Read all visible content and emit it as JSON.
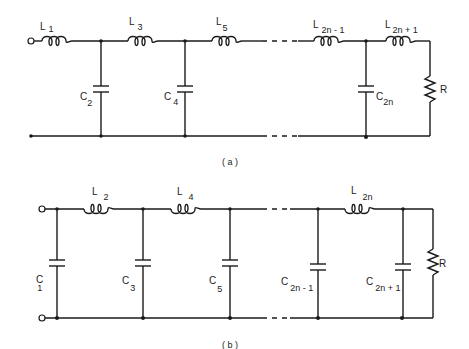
{
  "figure": {
    "a": {
      "caption": "( a )",
      "inductors": [
        {
          "name": "L",
          "sub": "1"
        },
        {
          "name": "L",
          "sub": "3"
        },
        {
          "name": "L",
          "sub": "5"
        },
        {
          "name": "L",
          "sub": "2n - 1"
        },
        {
          "name": "L",
          "sub": "2n + 1"
        }
      ],
      "capacitors": [
        {
          "name": "C",
          "sub": "2"
        },
        {
          "name": "C",
          "sub": "4"
        },
        {
          "name": "C",
          "sub": "2n"
        }
      ],
      "load": "R"
    },
    "b": {
      "caption": "( b )",
      "inductors": [
        {
          "name": "L",
          "sub": "2"
        },
        {
          "name": "L",
          "sub": "4"
        },
        {
          "name": "L",
          "sub": "2n"
        }
      ],
      "capacitors": [
        {
          "name": "C",
          "sub": "1"
        },
        {
          "name": "C",
          "sub": "3"
        },
        {
          "name": "C",
          "sub": "5"
        },
        {
          "name": "C",
          "sub": "2n - 1"
        },
        {
          "name": "C",
          "sub": "2n + 1"
        }
      ],
      "load": "R"
    }
  }
}
